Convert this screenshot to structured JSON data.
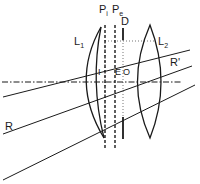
{
  "diagram": {
    "type": "optical-lens-system",
    "colors": {
      "ink": "#1a1a1a",
      "background": "#ffffff"
    },
    "labels": {
      "plane_in": {
        "main": "P",
        "sub": "i"
      },
      "plane_exit": {
        "main": "P",
        "sub": "e"
      },
      "diaphragm": "D",
      "lens1": {
        "main": "L",
        "sub": "1"
      },
      "lens2": {
        "main": "L",
        "sub": "2"
      },
      "point_i": "I",
      "point_e": "E",
      "point_o": "O",
      "ray_in": "R",
      "ray_out": "R'"
    },
    "elements": [
      "optical-axis",
      "lens-L1-meniscus",
      "lens-L2-biconvex",
      "plane-Pi",
      "plane-Pe",
      "diaphragm-D",
      "ray-upper",
      "ray-R",
      "ray-lower"
    ]
  }
}
